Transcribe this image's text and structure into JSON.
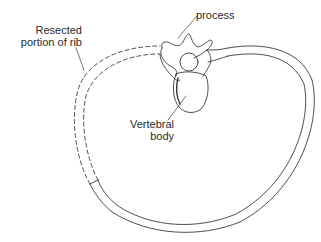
{
  "diagram": {
    "labels": {
      "process": "process",
      "resected_line1": "Resected",
      "resected_line2": "portion of rib",
      "vertebral_line1": "Vertebral",
      "vertebral_line2": "body"
    },
    "colors": {
      "line": "#3a3a3a",
      "background": "#ffffff",
      "text": "#2a2a2a"
    },
    "line_styles": {
      "resected_segment": "dashed",
      "intact_rib": "solid"
    }
  }
}
